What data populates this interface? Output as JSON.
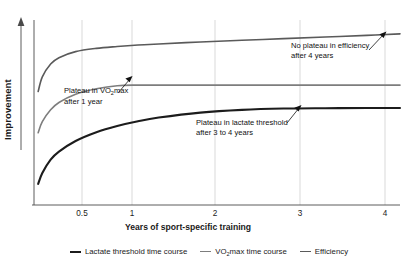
{
  "chart_data": {
    "type": "line",
    "title": "",
    "xlabel": "Years of sport-specific training",
    "ylabel": "Improvement",
    "xlim": [
      0,
      4.4
    ],
    "ylim": [
      0,
      1
    ],
    "grid": true,
    "grid_axis": "x",
    "legend_position": "bottom",
    "xticks": [
      0.5,
      1,
      2,
      3,
      4
    ],
    "xticklabels": [
      "0.5",
      "1",
      "2",
      "3",
      "4"
    ],
    "yticks": [],
    "yticklabels": [],
    "y_axis_arrow": true,
    "x": [
      0.05,
      0.1,
      0.2,
      0.3,
      0.5,
      0.75,
      1.0,
      1.25,
      1.5,
      2.0,
      2.5,
      3.0,
      3.5,
      4.0,
      4.4
    ],
    "series": [
      {
        "name": "Efficiency",
        "color": "#5a5a5a",
        "linewidth": 1.6,
        "values": [
          0.62,
          0.7,
          0.77,
          0.805,
          0.838,
          0.856,
          0.866,
          0.874,
          0.88,
          0.891,
          0.9,
          0.909,
          0.918,
          0.927,
          0.935
        ]
      },
      {
        "name": "VO2max time course",
        "color": "#7d7d7d",
        "linewidth": 1.6,
        "values": [
          0.395,
          0.455,
          0.52,
          0.56,
          0.605,
          0.635,
          0.652,
          0.655,
          0.655,
          0.655,
          0.655,
          0.655,
          0.655,
          0.655,
          0.655
        ]
      },
      {
        "name": "Lactate threshold time course",
        "color": "#1c1c1c",
        "linewidth": 2.1,
        "values": [
          0.115,
          0.175,
          0.248,
          0.292,
          0.35,
          0.398,
          0.432,
          0.458,
          0.478,
          0.505,
          0.52,
          0.527,
          0.529,
          0.53,
          0.53
        ]
      }
    ],
    "annotations": [
      {
        "id": "efficiency",
        "line1": "No plateau in efficiency",
        "line2": "after 4 years",
        "target_x": 4.05,
        "target_y": 0.925
      },
      {
        "id": "vo2max",
        "line1_pre": "Plateau in VO",
        "line1_sub": "2",
        "line1_post": "max",
        "line2": "after 1 year",
        "target_x": 1.12,
        "target_y": 0.658
      },
      {
        "id": "lactate",
        "line1": "Plateau in lactate threshold",
        "line2": "after 3 to 4 years",
        "target_x": 2.82,
        "target_y": 0.53
      }
    ]
  },
  "legend": {
    "items": [
      {
        "label_pre": "Lactate threshold time course",
        "label_sub": "",
        "label_post": "",
        "color": "#1c1c1c",
        "width": 2.1
      },
      {
        "label_pre": "VO",
        "label_sub": "2",
        "label_post": "max time course",
        "color": "#7d7d7d",
        "width": 1.6
      },
      {
        "label_pre": "Efficiency",
        "label_sub": "",
        "label_post": "",
        "color": "#5a5a5a",
        "width": 1.6
      }
    ]
  },
  "axes": {
    "y_title": "Improvement",
    "x_title": "Years of sport-specific training"
  }
}
